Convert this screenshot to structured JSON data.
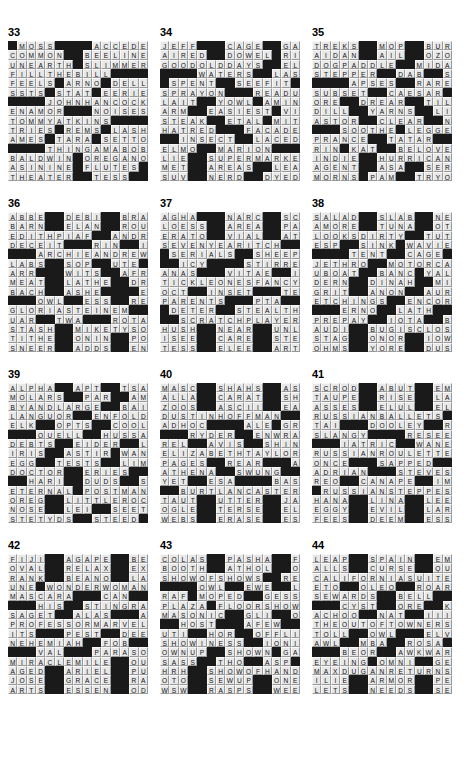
{
  "page": {
    "kind": "crossword-answer-grids",
    "columns": 3,
    "rows": 4,
    "grid_size": 15
  },
  "puzzles": [
    {
      "number": "33",
      "rows": [
        "#MOSS####ACCEDES",
        "COMMON##BEELINE",
        "UNEARTH#SLIMMER",
        "FILLTHEBILL####",
        "FEELS#ARNO#DELL",
        "SSTS#STAT#EERIE",
        "####JOHNHANCOCK",
        "ENAMOR###NOISES",
        "TOMMYATKINS####",
        "TRIES#REMS#LASH",
        "AMES#TARA#SETTO",
        "####THINGAMABOB",
        "BALDWIN#OREGANO",
        "ASININE#FLUTES#",
        "THEATER##TESS##"
      ]
    },
    {
      "number": "34",
      "rows": [
        "JEFF###CAGE##GAS",
        "AIRED##DOWEL#RIO",
        "GOODOLDDAYS##ELF",
        "####WATERS##LAST",
        "#SPENT##SEEFIT##",
        "SPRAYON###READUP",
        "LAIT##YOWL#AMINO",
        "ARM##EASIEST#VIP",
        "STEAK##ETAL#MITE",
        "HATRED###FACADES",
        "##INSECT##LACED#",
        "ELMO##MARION####",
        "LIE##SUPERMARKET",
        "MET##AREAS##LEAVE",
        "SUV##NERD##DYED#"
      ]
    },
    {
      "number": "35",
      "rows": [
        "TREKS##MOP##BURST",
        "AIDAN##AIL##OZONE",
        "DOGPADDLE##MIDAS",
        "STEPPER##DAB##SIT",
        "####APSES##RARELY",
        "SUBSET##CAESAR##",
        "ORE##DREAR##TILES",
        "DILL##YARNS##LIRE",
        "ASTOR##CLEAR##NIN",
        "###SOOTHE#LEGGED",
        "PRANCE##TATAR###",
        "RIN#KAT##BELOVED",
        "INDIE##HURRICANE",
        "AGENT##ASA##SERTA",
        "MORNS#PAM##TRYON"
      ]
    },
    {
      "number": "36",
      "rows": [
        "ABBE##DEBI##BRASS",
        "BARN##ELAN##ROUTE",
        "EDITHPIAF##ANDRE",
        "DECEIT###RIN##IAM",
        "###ARCHIEANDREWS",
        "LABS##SOP##UTE###",
        "ARR###WITS##AFRO",
        "MEAT##LATHE##DRAW",
        "BACH##ASHE####EVE",
        "###OWL##ESS##REED",
        "GLORIASTEINEM###",
        "UAR##TWA###ROTATE",
        "STASH##MIKETYSON",
        "TITHE##ONIN##POLO",
        "SNEER##ADDS##ENDS"
      ]
    },
    {
      "number": "37",
      "rows": [
        "AGHA###NARC##SCAT",
        "LOESS##AREA##PAGE",
        "ERATO##VIAL##ATOM",
        "SEVENYEARITCH###",
        "#SERIALS##SHEEP#",
        "##ICY####STIRRER",
        "ANAS###VITAE##INA",
        "TICKLEONESFANCY",
        "OCT##INSET###TEES",
        "PARENTS###PTA###",
        "#DETER##STEALTH#",
        "##SCRATCHPLAYER",
        "HUSH##NEAR##UNLAY",
        "ISEE##CARE##STERE",
        "TESS##ELEE##ARTS"
      ]
    },
    {
      "number": "38",
      "rows": [
        "SALAD##SLAB##NEED",
        "AMORE##TUNA##OTTO",
        "LOOKSDIRTY##TUTU",
        "ESP##SINK#WAVIER",
        "####TENT##CAGE###",
        "JETHRO##MOTORCAR",
        "UBOAT##BANC#YALE",
        "DERN##DINAH##MITE",
        "GRIT##ANON##AURAS",
        "ETCHINGS##ENCORE",
        "###ERNO##LATH###",
        "PREPAY##IOTA##BID",
        "AUDI##BUGISCLOSE",
        "STAG##ONOR##IOWAN",
        "OHMS##YORE##DUSTY"
      ]
    },
    {
      "number": "39",
      "rows": [
        "ALPHA##APT##TSAR",
        "MOLARS##PAR##AMMO",
        "BYANDLARGE##BAIT",
        "LANGUOR##ENFOLDS",
        "ELK##OPTS##COOL##",
        "###QUELL##HUSSAR",
        "DEBTS##EIDER##LOU",
        "IRIS##ASTIR#WANE",
        "EGG##TESTS##LIMES",
        "DOCTOR##ERIES###",
        "##HARI##DUDS##SCI",
        "ETERNAL#POSTMAN",
        "OREG##LITTLEROCK",
        "NOSE##LEI##SEETHE",
        "STETYDS##STEED##"
      ]
    },
    {
      "number": "40",
      "rows": [
        "MASC##SHAHS##ASKS",
        "ALLA##CARAT##SHOO",
        "ZOOS##ASCII##EASY",
        "DUSTINHOFFMAN###",
        "ADHOC####ALE#GRO",
        "###RYDER##ENWRAP",
        "REL##AVIS##SHINE",
        "ELIZABETHTAYLOR",
        "PAGES##REAR###ANA",
        "ATHENA##SWUNG###",
        "YET##ESA####BASTA",
        "##BURTLANCASTER",
        "TAUT##UTTER##JAPE",
        "OGLE##TERSE##ELIA",
        "WEBS##ERASE##ESSE"
      ]
    },
    {
      "number": "41",
      "rows": [
        "SCROD##ABUT##EMMA",
        "TAUPE##RISE##LAID",
        "ASSES##ELUL##ELSE",
        "RUSSIANBALLETS#",
        "TAI###DOOLEY##RPI",
        "SLANGY####RESEED",
        "###IATRIC##WANE",
        "RUSSIANROULETTE",
        "ONCE###SAPPED###",
        "ADRIAN###STEVES",
        "REO##CANAPE##IMA",
        "#RUSSIANSTEPPES",
        "HANA##LINA##LEERS",
        "EGGY##EVIL##LARGE",
        "FEES##DEEM##ESSES"
      ]
    },
    {
      "number": "42",
      "rows": [
        "FIJI##AGAPE##BEGS",
        "OVAL##RELAX##EXIT",
        "RANK##BEANO##LAZE",
        "UNE#WONDERWOMAN",
        "MASCARA###CAN###",
        "###HIS##STINGRAY",
        "SAGET##ALAS###AVA",
        "PROFESSORMARVEL",
        "ITS###PEST##DEERE",
        "NEHEMIAH##FOB###",
        "###VAL###PARASOL",
        "MIRACLEMILE##QUO",
        "AGED##ARIEL##PUNS",
        "JOSE##GRACE##RACE",
        "ARTS##ESSEN##ODES"
      ]
    },
    {
      "number": "43",
      "rows": [
        "COLAS##PASHA##FAN",
        "BOOTH##ATHOL##ORO",
        "SHOWOFSHOWS##RES",
        "####OWL##EWE##LEAH",
        "RAF#MOPED##GESSO",
        "PLAZA#FLOORSHOW",
        "MASONIC##GLI##ONS",
        "##HOST###AFEW##",
        "UTI##HOR##OFFLINE",
        "SHOWINESS##IONIA",
        "OWNUP##SHOWN#GAT",
        "SASS##THO##ASP###",
        "HRH##SHOWOFHANDS",
        "OTO##SEWUP##ONEAL",
        "WSW##RASPS##WEEDY"
      ]
    },
    {
      "number": "44",
      "rows": [
        "LEAP##SPAIN##EMMA",
        "ALLS##CURSE##QUIP",
        "CALIFORNIASUITE",
        "ETO##OLEO##ROARED",
        "SEWARDS##BELL###",
        "###CYST##ORE##KKK",
        "ACHOO##NAT##IIII",
        "THEOUTOFTOWNERS",
        "TOLL##OWL###ELVIS",
        "AWL##MBA##ROSA###",
        "###BEOR##AWKWARD",
        "EYEING#OMNI##GEE",
        "MAXDUGANRETURNS",
        "ILIE##ARMOR##PEEK",
        "LETS##NEEDS##SEWS"
      ]
    }
  ]
}
